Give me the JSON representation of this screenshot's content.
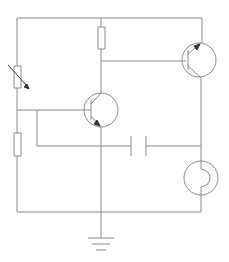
{
  "diagram": {
    "type": "circuit-schematic",
    "colors": {
      "background": "#ffffff",
      "wire": "#8a8a8a",
      "arrow": "#333333"
    },
    "components": [
      {
        "id": "R_var",
        "kind": "variable-resistor",
        "label": ""
      },
      {
        "id": "R_bottom",
        "kind": "resistor",
        "label": ""
      },
      {
        "id": "R_top",
        "kind": "resistor",
        "label": ""
      },
      {
        "id": "T1",
        "kind": "npn-transistor",
        "label": ""
      },
      {
        "id": "T2",
        "kind": "pnp-transistor",
        "label": ""
      },
      {
        "id": "C1",
        "kind": "capacitor",
        "label": ""
      },
      {
        "id": "L1",
        "kind": "lamp",
        "label": ""
      },
      {
        "id": "GND",
        "kind": "ground",
        "label": ""
      }
    ]
  }
}
